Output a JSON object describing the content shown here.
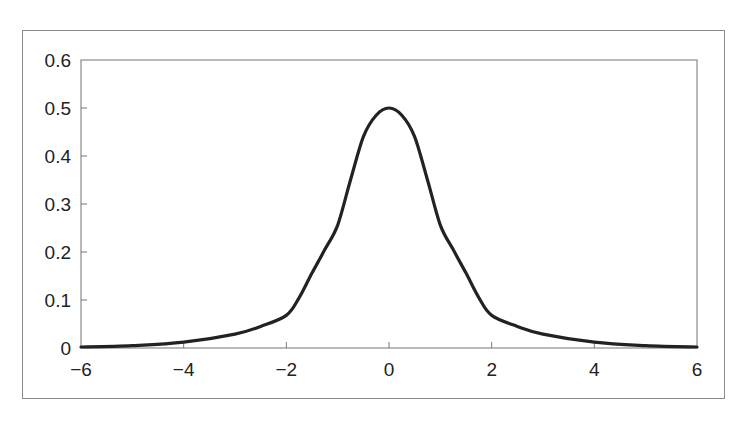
{
  "header": {
    "cut_title": ""
  },
  "chart_data": {
    "type": "line",
    "title": "",
    "xlabel": "",
    "ylabel": "",
    "xlim": [
      -6,
      6
    ],
    "ylim": [
      0,
      0.6
    ],
    "grid": false,
    "legend": null,
    "x_ticks": [
      "−6",
      "−4",
      "−2",
      "0",
      "2",
      "4",
      "6"
    ],
    "x_tick_values": [
      -6,
      -4,
      -2,
      0,
      2,
      4,
      6
    ],
    "y_ticks": [
      "0",
      "0.1",
      "0.2",
      "0.3",
      "0.4",
      "0.5",
      "0.6"
    ],
    "y_tick_values": [
      0,
      0.1,
      0.2,
      0.3,
      0.4,
      0.5,
      0.6
    ],
    "series": [
      {
        "name": "density",
        "color": "#222222",
        "x": [
          -6,
          -5,
          -4,
          -3,
          -2.5,
          -2,
          -1.75,
          -1.5,
          -1.25,
          -1,
          -0.75,
          -0.5,
          -0.25,
          0,
          0.25,
          0.5,
          0.75,
          1,
          1.25,
          1.5,
          1.75,
          2,
          2.5,
          3,
          4,
          5,
          6
        ],
        "values": [
          0.002,
          0.005,
          0.012,
          0.029,
          0.045,
          0.068,
          0.105,
          0.156,
          0.205,
          0.256,
          0.35,
          0.44,
          0.485,
          0.5,
          0.485,
          0.44,
          0.35,
          0.256,
          0.205,
          0.156,
          0.105,
          0.068,
          0.045,
          0.029,
          0.012,
          0.005,
          0.002
        ]
      }
    ]
  }
}
